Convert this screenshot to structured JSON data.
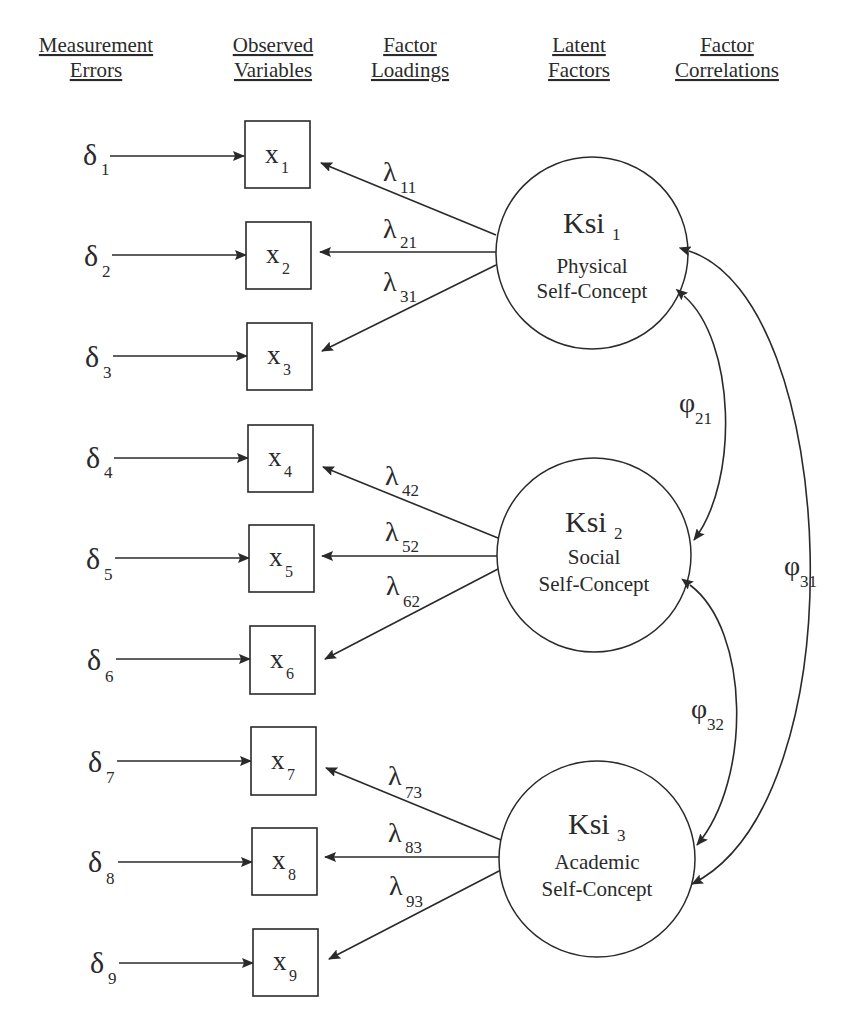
{
  "headers": [
    {
      "line1": "Measurement",
      "line2": "Errors",
      "cx": 96
    },
    {
      "line1": "Observed",
      "line2": "Variables",
      "cx": 273
    },
    {
      "line1": "Factor",
      "line2": "Loadings",
      "cx": 410
    },
    {
      "line1": "Latent",
      "line2": "Factors",
      "cx": 579
    },
    {
      "line1": "Factor",
      "line2": "Correlations",
      "cx": 727
    }
  ],
  "colors": {
    "ink": "#2a2a2a",
    "background": "#ffffff"
  },
  "errors": [
    {
      "symbol": "δ",
      "sub": "1"
    },
    {
      "symbol": "δ",
      "sub": "2"
    },
    {
      "symbol": "δ",
      "sub": "3"
    },
    {
      "symbol": "δ",
      "sub": "4"
    },
    {
      "symbol": "δ",
      "sub": "5"
    },
    {
      "symbol": "δ",
      "sub": "6"
    },
    {
      "symbol": "δ",
      "sub": "7"
    },
    {
      "symbol": "δ",
      "sub": "8"
    },
    {
      "symbol": "δ",
      "sub": "9"
    }
  ],
  "observed": [
    {
      "symbol": "x",
      "sub": "1"
    },
    {
      "symbol": "x",
      "sub": "2"
    },
    {
      "symbol": "x",
      "sub": "3"
    },
    {
      "symbol": "x",
      "sub": "4"
    },
    {
      "symbol": "x",
      "sub": "5"
    },
    {
      "symbol": "x",
      "sub": "6"
    },
    {
      "symbol": "x",
      "sub": "7"
    },
    {
      "symbol": "x",
      "sub": "8"
    },
    {
      "symbol": "x",
      "sub": "9"
    }
  ],
  "loadings": [
    {
      "symbol": "λ",
      "sub": "11",
      "from_factor": 0,
      "to_var": 0
    },
    {
      "symbol": "λ",
      "sub": "21",
      "from_factor": 0,
      "to_var": 1
    },
    {
      "symbol": "λ",
      "sub": "31",
      "from_factor": 0,
      "to_var": 2
    },
    {
      "symbol": "λ",
      "sub": "42",
      "from_factor": 1,
      "to_var": 3
    },
    {
      "symbol": "λ",
      "sub": "52",
      "from_factor": 1,
      "to_var": 4
    },
    {
      "symbol": "λ",
      "sub": "62",
      "from_factor": 1,
      "to_var": 5
    },
    {
      "symbol": "λ",
      "sub": "73",
      "from_factor": 2,
      "to_var": 6
    },
    {
      "symbol": "λ",
      "sub": "83",
      "from_factor": 2,
      "to_var": 7
    },
    {
      "symbol": "λ",
      "sub": "93",
      "from_factor": 2,
      "to_var": 8
    }
  ],
  "factors": [
    {
      "name": "Ksi",
      "sub": "1",
      "label1": "Physical",
      "label2": "Self-Concept"
    },
    {
      "name": "Ksi",
      "sub": "2",
      "label1": "Social",
      "label2": "Self-Concept"
    },
    {
      "name": "Ksi",
      "sub": "3",
      "label1": "Academic",
      "label2": "Self-Concept"
    }
  ],
  "correlations": [
    {
      "symbol": "φ",
      "sub": "21",
      "between": [
        1,
        0
      ]
    },
    {
      "symbol": "φ",
      "sub": "32",
      "between": [
        2,
        1
      ]
    },
    {
      "symbol": "φ",
      "sub": "31",
      "between": [
        2,
        0
      ]
    }
  ]
}
